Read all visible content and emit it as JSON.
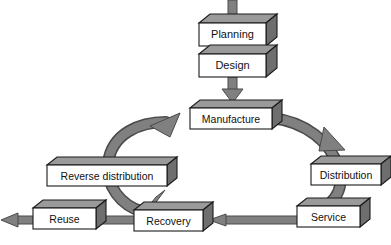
{
  "diagram": {
    "type": "flow-diagram",
    "style": {
      "background": "#ffffff",
      "box_face": "#ffffff",
      "box_top": "#9a9a9a",
      "box_side": "#6e6e6e",
      "box_outline": "#1a1a1a",
      "arrow_fill": "#808080",
      "arrow_outline": "#3a3a3a",
      "text_color": "#111111"
    },
    "nodes": [
      {
        "id": "planning",
        "label": "Planning",
        "x": 199,
        "y": 23,
        "w": 67,
        "h": 23
      },
      {
        "id": "design",
        "label": "Design",
        "x": 199,
        "y": 54,
        "w": 67,
        "h": 23
      },
      {
        "id": "manufacture",
        "label": "Manufacture",
        "x": 190,
        "y": 108,
        "w": 82,
        "h": 21
      },
      {
        "id": "distribution",
        "label": "Distribution",
        "x": 311,
        "y": 164,
        "w": 70,
        "h": 21
      },
      {
        "id": "service",
        "label": "Service",
        "x": 297,
        "y": 206,
        "w": 63,
        "h": 21
      },
      {
        "id": "recovery",
        "label": "Recovery",
        "x": 134,
        "y": 210,
        "w": 69,
        "h": 21
      },
      {
        "id": "reuse",
        "label": "Reuse",
        "x": 33,
        "y": 208,
        "w": 63,
        "h": 21
      },
      {
        "id": "reverse",
        "label": "Reverse distribution",
        "x": 47,
        "y": 165,
        "w": 120,
        "h": 21
      }
    ],
    "connections": [
      {
        "id": "input-to-planning",
        "from": "",
        "to": "planning",
        "kind": "straight-down"
      },
      {
        "id": "planning-to-design",
        "from": "planning",
        "to": "design",
        "kind": "straight-down"
      },
      {
        "id": "design-to-manufacture",
        "from": "design",
        "to": "manufacture",
        "kind": "straight-down-arrow"
      },
      {
        "id": "manufacture-to-distribution",
        "from": "manufacture",
        "to": "distribution",
        "kind": "curve-right-down"
      },
      {
        "id": "distribution-to-service",
        "from": "distribution",
        "to": "service",
        "kind": "curve-down"
      },
      {
        "id": "service-to-recovery",
        "from": "service",
        "to": "recovery",
        "kind": "straight-left-arrow"
      },
      {
        "id": "recovery-to-reuse",
        "from": "recovery",
        "to": "reuse",
        "kind": "straight-left"
      },
      {
        "id": "reuse-output",
        "from": "reuse",
        "to": "",
        "kind": "straight-left-arrow"
      },
      {
        "id": "recovery-to-reverse",
        "from": "recovery",
        "to": "reverse",
        "kind": "diagonal-up"
      },
      {
        "id": "reverse-to-manufacture",
        "from": "reverse",
        "to": "manufacture",
        "kind": "curve-up-right-arrow"
      }
    ]
  }
}
